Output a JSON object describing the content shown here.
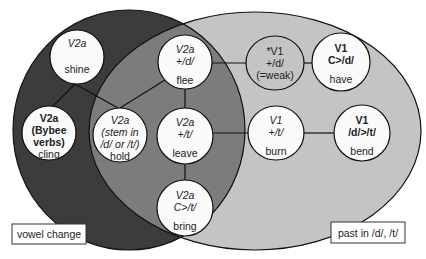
{
  "colors": {
    "background": "#ffffff",
    "vowel_change_only": "#3c3c3c",
    "overlap": "#7c7c7c",
    "past_dt_only": "#c4c4c4",
    "node_fill": "#fafafa",
    "node_gray_fill": "#c4c4c4",
    "stroke": "#111111"
  },
  "sets": {
    "vowel_change": {
      "label": "vowel change",
      "cx": 129,
      "cy": 130,
      "rx": 116,
      "ry": 120
    },
    "past_dt": {
      "label": "past in /d/, /t/",
      "cx": 255,
      "cy": 131,
      "rx": 166,
      "ry": 119
    }
  },
  "labels": {
    "vowel_change": {
      "text": "vowel change",
      "x": 12,
      "y": 224,
      "w": 74,
      "h": 20
    },
    "past_dt": {
      "text": "past in /d/, /t/",
      "x": 331,
      "y": 222,
      "w": 74,
      "h": 21
    }
  },
  "nodes": [
    {
      "id": "shine",
      "cx": 77,
      "cy": 57,
      "rx": 27,
      "ry": 27,
      "gray": false,
      "lines": [
        {
          "text": "V2a",
          "y": -14,
          "style": "it"
        },
        {
          "text": "shine",
          "y": 12,
          "style": ""
        }
      ]
    },
    {
      "id": "cling",
      "cx": 49,
      "cy": 133,
      "rx": 27,
      "ry": 27,
      "gray": false,
      "lines": [
        {
          "text": "V2a",
          "y": -15,
          "style": "bd"
        },
        {
          "text": "(Bybee",
          "y": -3,
          "style": "bd"
        },
        {
          "text": "verbs)",
          "y": 9,
          "style": "bd"
        },
        {
          "text": "cling",
          "y": 21,
          "style": ""
        }
      ]
    },
    {
      "id": "hold",
      "cx": 120,
      "cy": 135,
      "rx": 27,
      "ry": 27,
      "gray": false,
      "lines": [
        {
          "text": "V2a",
          "y": -15,
          "style": "it"
        },
        {
          "text": "(stem in",
          "y": -3,
          "style": "it"
        },
        {
          "text": "/d/ or /t/)",
          "y": 9,
          "style": "it"
        },
        {
          "text": "hold",
          "y": 21,
          "style": ""
        }
      ]
    },
    {
      "id": "flee",
      "cx": 185,
      "cy": 62,
      "rx": 27,
      "ry": 27,
      "gray": false,
      "lines": [
        {
          "text": "V2a",
          "y": -13,
          "style": "it"
        },
        {
          "text": "+/d/",
          "y": -1,
          "style": "it"
        },
        {
          "text": "flee",
          "y": 18,
          "style": ""
        }
      ]
    },
    {
      "id": "leave",
      "cx": 185,
      "cy": 136,
      "rx": 28,
      "ry": 28,
      "gray": false,
      "lines": [
        {
          "text": "V2a",
          "y": -14,
          "style": "it"
        },
        {
          "text": "+/t/",
          "y": -2,
          "style": "it"
        },
        {
          "text": "leave",
          "y": 17,
          "style": ""
        }
      ]
    },
    {
      "id": "bring",
      "cx": 185,
      "cy": 208,
      "rx": 28,
      "ry": 28,
      "gray": false,
      "lines": [
        {
          "text": "V2a",
          "y": -13,
          "style": "it"
        },
        {
          "text": "C>/t/",
          "y": -1,
          "style": "it"
        },
        {
          "text": "bring",
          "y": 18,
          "style": ""
        }
      ]
    },
    {
      "id": "weak",
      "cx": 275,
      "cy": 63,
      "rx": 29,
      "ry": 27,
      "gray": true,
      "lines": [
        {
          "text": "*V1",
          "y": -12,
          "style": ""
        },
        {
          "text": "+/d/",
          "y": 0,
          "style": ""
        },
        {
          "text": "(=weak)",
          "y": 12,
          "style": ""
        }
      ]
    },
    {
      "id": "have",
      "cx": 341,
      "cy": 62,
      "rx": 29,
      "ry": 29,
      "gray": false,
      "lines": [
        {
          "text": "V1",
          "y": -14,
          "style": "bd"
        },
        {
          "text": "C>/d/",
          "y": -2,
          "style": "bd"
        },
        {
          "text": "have",
          "y": 17,
          "style": ""
        }
      ]
    },
    {
      "id": "burn",
      "cx": 276,
      "cy": 133,
      "rx": 28,
      "ry": 27,
      "gray": false,
      "lines": [
        {
          "text": "V1",
          "y": -13,
          "style": "it"
        },
        {
          "text": "+/t/",
          "y": -1,
          "style": "it"
        },
        {
          "text": "burn",
          "y": 18,
          "style": ""
        }
      ]
    },
    {
      "id": "bend",
      "cx": 362,
      "cy": 133,
      "rx": 28,
      "ry": 28,
      "gray": false,
      "lines": [
        {
          "text": "V1",
          "y": -13,
          "style": "bd"
        },
        {
          "text": "/d/>/t/",
          "y": -1,
          "style": "bd"
        },
        {
          "text": "bend",
          "y": 18,
          "style": ""
        }
      ]
    }
  ],
  "edges": [
    {
      "from": "shine",
      "to": "cling",
      "x1": 75,
      "y1": 84,
      "x2": 53,
      "y2": 106
    },
    {
      "from": "shine",
      "to": "hold",
      "x1": 75,
      "y1": 84,
      "x2": 118,
      "y2": 108
    },
    {
      "from": "flee",
      "to": "hold",
      "x1": 165,
      "y1": 80,
      "x2": 120,
      "y2": 108
    },
    {
      "from": "flee",
      "to": "leave",
      "x1": 185,
      "y1": 89,
      "x2": 185,
      "y2": 108
    },
    {
      "from": "leave",
      "to": "bring",
      "x1": 185,
      "y1": 164,
      "x2": 185,
      "y2": 180
    },
    {
      "from": "flee",
      "to": "weak",
      "x1": 212,
      "y1": 63,
      "x2": 246,
      "y2": 63
    },
    {
      "from": "weak",
      "to": "have",
      "x1": 304,
      "y1": 63,
      "x2": 312,
      "y2": 63
    },
    {
      "from": "leave",
      "to": "burn",
      "x1": 213,
      "y1": 133,
      "x2": 248,
      "y2": 133
    },
    {
      "from": "burn",
      "to": "bend",
      "x1": 304,
      "y1": 133,
      "x2": 334,
      "y2": 133
    }
  ]
}
